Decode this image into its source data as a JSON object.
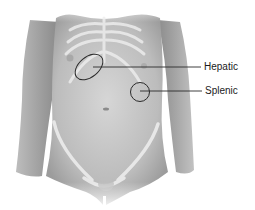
{
  "figure": {
    "labels": [
      {
        "id": "hepatic",
        "text": "Hepatic"
      },
      {
        "id": "splenic",
        "text": "Splenic"
      }
    ],
    "colors": {
      "skin_light": "#e2e2e2",
      "skin_mid": "#c4c4c4",
      "skin_dark": "#9a9a9a",
      "bone": "#eeeeee",
      "marker": "#2a2a2a"
    }
  }
}
